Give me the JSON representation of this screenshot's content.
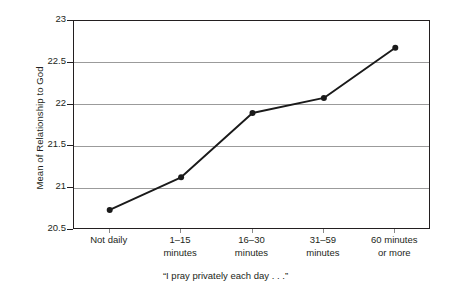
{
  "chart_data": {
    "type": "line",
    "title": "",
    "xlabel": "“I pray privately each day . . .”",
    "ylabel": "Mean of Relationship to God",
    "categories": [
      "Not daily",
      "1–15 minutes",
      "16–30 minutes",
      "31–59 minutes",
      "60 minutes or more"
    ],
    "category_lines": [
      [
        "Not daily",
        ""
      ],
      [
        "1–15",
        "minutes"
      ],
      [
        "16–30",
        "minutes"
      ],
      [
        "31–59",
        "minutes"
      ],
      [
        "60 minutes",
        "or more"
      ]
    ],
    "values": [
      20.74,
      21.13,
      21.9,
      22.08,
      22.68
    ],
    "ylim": [
      20.5,
      23
    ],
    "ytick_labels": [
      "23",
      "22.5",
      "22",
      "21.5",
      "21",
      "20.5"
    ],
    "ytick_values": [
      23,
      22.5,
      22,
      21.5,
      21,
      20.5
    ],
    "grid": true,
    "legend": "none",
    "series": [
      {
        "name": "Mean of Relationship to God",
        "values": [
          20.74,
          21.13,
          21.9,
          22.08,
          22.68
        ]
      }
    ],
    "colors": {
      "line": "#1a1a1a",
      "marker": "#1a1a1a",
      "grid": "#9b9b9b",
      "axis": "#231f20",
      "background": "#ffffff"
    }
  }
}
